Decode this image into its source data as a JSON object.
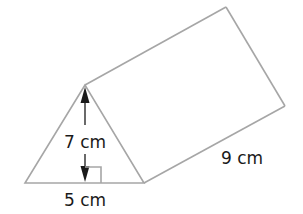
{
  "figure": {
    "type": "triangular prism",
    "labels": {
      "height": "7 cm",
      "base": "5 cm",
      "length": "9 cm"
    },
    "colors": {
      "edges": "#a6a6a6",
      "annotations": "#1a1a1a",
      "background": "#ffffff"
    }
  }
}
